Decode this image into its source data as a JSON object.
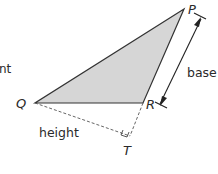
{
  "diagram": {
    "partial_label": "nt",
    "vertices": {
      "P": "P",
      "Q": "Q",
      "R": "R",
      "T": "T"
    },
    "labels": {
      "base": "base",
      "height": "height"
    },
    "colors": {
      "fill": "#d6d6d6",
      "stroke": "#333333",
      "dashed": "#555555"
    },
    "elements": [
      {
        "type": "triangle",
        "points": [
          "P",
          "Q",
          "R"
        ],
        "shaded": true
      },
      {
        "type": "dashed-line",
        "from": "Q",
        "to": "T",
        "label": "height"
      },
      {
        "type": "dashed-line",
        "from": "R",
        "to": "T",
        "note": "extension of PR"
      },
      {
        "type": "right-angle-marker",
        "at": "T"
      },
      {
        "type": "double-arrow",
        "along": "PR",
        "label": "base"
      }
    ]
  }
}
